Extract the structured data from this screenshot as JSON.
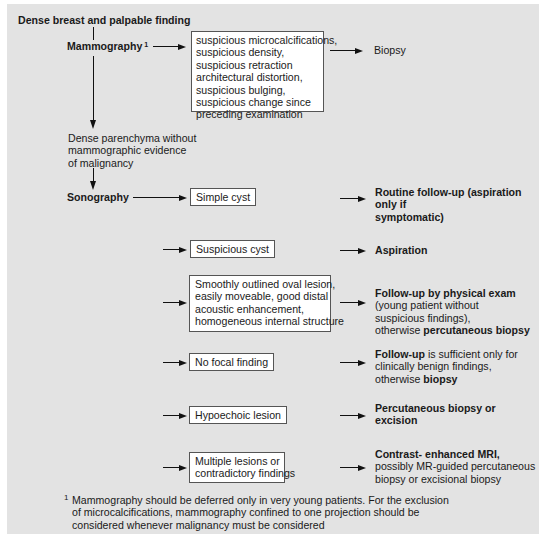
{
  "title": "Dense breast and palpable finding",
  "nodes": {
    "mammography": {
      "label": "Mammography",
      "footnote_mark": "1"
    },
    "mammo_findings": [
      "suspicious microcalcifications,",
      "suspicious density,",
      "suspicious retraction",
      "architectural distortion,",
      "suspicious bulging,",
      "suspicious change since",
      "preceding examination"
    ],
    "biopsy": "Biopsy",
    "dense_parenchyma": [
      "Dense parenchyma without",
      "mammographic evidence",
      "of malignancy"
    ],
    "sonography": "Sonography"
  },
  "sono_findings": [
    {
      "finding": [
        "Simple cyst"
      ],
      "outcome": [
        {
          "text": "Routine follow-up (aspiration only if",
          "bold": true
        },
        {
          "text": "symptomatic)",
          "bold": true
        }
      ]
    },
    {
      "finding": [
        "Suspicious cyst"
      ],
      "outcome": [
        {
          "text": "Aspiration",
          "bold": true
        }
      ]
    },
    {
      "finding": [
        "Smoothly outlined oval lesion,",
        "easily moveable, good distal",
        "acoustic enhancement,",
        "homogeneous internal structure"
      ],
      "outcome_lines": [
        [
          {
            "text": "Follow-up by physical exam",
            "bold": true
          }
        ],
        [
          {
            "text": "(young patient without",
            "bold": false
          }
        ],
        [
          {
            "text": "suspicious findings),",
            "bold": false
          }
        ],
        [
          {
            "text": "otherwise ",
            "bold": false
          },
          {
            "text": "percutaneous biopsy",
            "bold": true
          }
        ]
      ]
    },
    {
      "finding": [
        "No focal finding"
      ],
      "outcome_lines": [
        [
          {
            "text": "Follow-up",
            "bold": true
          },
          {
            "text": " is sufficient only for",
            "bold": false
          }
        ],
        [
          {
            "text": "clinically benign findings,",
            "bold": false
          }
        ],
        [
          {
            "text": "otherwise ",
            "bold": false
          },
          {
            "text": "biopsy",
            "bold": true
          }
        ]
      ]
    },
    {
      "finding": [
        "Hypoechoic lesion"
      ],
      "outcome_lines": [
        [
          {
            "text": "Percutaneous biopsy or",
            "bold": true
          }
        ],
        [
          {
            "text": "excision",
            "bold": true
          }
        ]
      ]
    },
    {
      "finding": [
        "Multiple lesions or",
        "contradictory findings"
      ],
      "outcome_lines": [
        [
          {
            "text": "Contrast- enhanced MRI,",
            "bold": true
          }
        ],
        [
          {
            "text": "possibly MR-guided percutaneous",
            "bold": false
          }
        ],
        [
          {
            "text": "biopsy or excisional biopsy",
            "bold": false
          }
        ]
      ]
    }
  ],
  "footnote": {
    "mark": "1",
    "lines": [
      "Mammography should be deferred only in very young patients. For the exclusion",
      "of microcalcifications, mammography confined to one projection should be",
      "considered whenever malignancy must be considered"
    ]
  },
  "colors": {
    "panel_bg": "#e3e3e3",
    "box_bg": "#ffffff",
    "ink": "#111111"
  }
}
